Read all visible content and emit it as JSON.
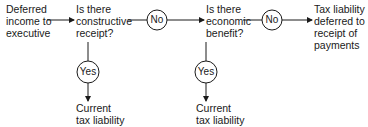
{
  "diagram": {
    "start": {
      "lines": [
        "Deferred",
        "income to",
        "executive"
      ]
    },
    "q1": {
      "lines": [
        "Is there",
        "constructive",
        "receipt?"
      ]
    },
    "q2": {
      "lines": [
        "Is there",
        "economic",
        "benefit?"
      ]
    },
    "outcome_deferred": {
      "lines": [
        "Tax liability",
        "deferred to",
        "receipt of",
        "payments"
      ]
    },
    "outcome_current_1": {
      "lines": [
        "Current",
        "tax liability"
      ]
    },
    "outcome_current_2": {
      "lines": [
        "Current",
        "tax liability"
      ]
    },
    "decision_labels": {
      "no_1": "No",
      "no_2": "No",
      "yes_1": "Yes",
      "yes_2": "Yes"
    },
    "line_color": "#1a1a1a"
  }
}
